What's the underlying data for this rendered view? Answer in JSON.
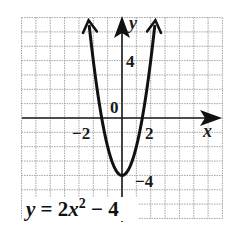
{
  "chart_data": {
    "type": "line",
    "title": "",
    "equation": "y = 2x^2 - 4",
    "equation_label": {
      "y_var": "y",
      "equals": " = 2",
      "x_var": "x",
      "exponent": "2",
      "rest": " − 4"
    },
    "xlabel": "x",
    "ylabel": "y",
    "xlim": [
      -7,
      7
    ],
    "ylim": [
      -7,
      7
    ],
    "grid": true,
    "grid_step": 1,
    "tick_labels": {
      "x": [
        {
          "value": -2,
          "label": "−2"
        },
        {
          "value": 2,
          "label": "2"
        }
      ],
      "y": [
        {
          "value": 4,
          "label": "4"
        },
        {
          "value": -4,
          "label": "−4"
        }
      ],
      "origin": "0"
    },
    "series": [
      {
        "name": "y = 2x^2 - 4",
        "x": [
          -2.3,
          -2,
          -1.5,
          -1.41,
          -1,
          -0.5,
          0,
          0.5,
          1,
          1.41,
          1.5,
          2,
          2.3
        ],
        "y": [
          6.58,
          4,
          0.5,
          0,
          -2,
          -3.5,
          -4,
          -3.5,
          -2,
          0,
          0.5,
          4,
          6.58
        ]
      }
    ],
    "key_points": {
      "vertex": [
        0,
        -4
      ],
      "x_intercepts": [
        -1.41,
        1.41
      ],
      "y_intercept": -4
    },
    "arrows": "both ends of parabola and positive axes"
  },
  "colors": {
    "curve": "#111111",
    "axis": "#1a1a1a",
    "grid": "#9a9a9a",
    "background": "#ffffff"
  }
}
